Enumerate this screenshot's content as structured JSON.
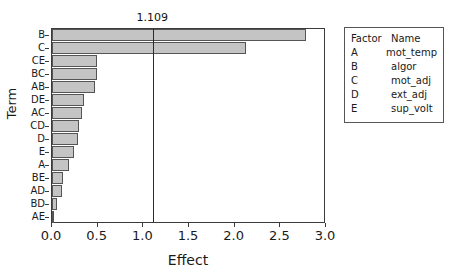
{
  "chart_data": {
    "type": "bar",
    "orientation": "horizontal",
    "title": "",
    "xlabel": "Effect",
    "ylabel": "Term",
    "xlim": [
      0.0,
      3.0
    ],
    "xticks": [
      "0.0",
      "0.5",
      "1.0",
      "1.5",
      "2.0",
      "2.5",
      "3.0"
    ],
    "xtick_values": [
      0.0,
      0.5,
      1.0,
      1.5,
      2.0,
      2.5,
      3.0
    ],
    "grid": false,
    "legend_position": "right",
    "categories": [
      "B",
      "C",
      "CE",
      "BC",
      "AB",
      "DE",
      "AC",
      "CD",
      "D",
      "E",
      "A",
      "BE",
      "AD",
      "BD",
      "AE"
    ],
    "values": [
      2.78,
      2.12,
      0.49,
      0.49,
      0.47,
      0.35,
      0.33,
      0.3,
      0.29,
      0.24,
      0.19,
      0.12,
      0.11,
      0.05,
      0.01
    ],
    "reference_line": {
      "value": 1.109,
      "label": "1.109"
    },
    "bar_fill_color": "#c4c4c4",
    "bar_edge_color": "#555555",
    "axis_color": "#3b3b3b"
  },
  "legend": {
    "headers": {
      "factor": "Factor",
      "name": "Name"
    },
    "rows": [
      {
        "factor": "A",
        "name": "mot_temp"
      },
      {
        "factor": "B",
        "name": "algor"
      },
      {
        "factor": "C",
        "name": "mot_adj"
      },
      {
        "factor": "D",
        "name": "ext_adj"
      },
      {
        "factor": "E",
        "name": "sup_volt"
      }
    ]
  }
}
